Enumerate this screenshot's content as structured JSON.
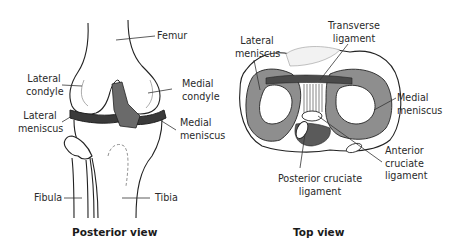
{
  "panels": {
    "posterior": {
      "caption": "Posterior view",
      "labels": {
        "femur": "Femur",
        "lateral_condyle_1": "Lateral",
        "lateral_condyle_2": "condyle",
        "medial_condyle_1": "Medial",
        "medial_condyle_2": "condyle",
        "lateral_meniscus_1": "Lateral",
        "lateral_meniscus_2": "meniscus",
        "medial_meniscus_1": "Medial",
        "medial_meniscus_2": "meniscus",
        "fibula": "Fibula",
        "tibia": "Tibia"
      }
    },
    "top": {
      "caption": "Top view",
      "labels": {
        "lateral_meniscus_1": "Lateral",
        "lateral_meniscus_2": "meniscus",
        "transverse_ligament_1": "Transverse",
        "transverse_ligament_2": "ligament",
        "medial_meniscus_1": "Medial",
        "medial_meniscus_2": "meniscus",
        "anterior_cruciate_1": "Anterior",
        "anterior_cruciate_2": "cruciate",
        "anterior_cruciate_3": "ligament",
        "posterior_cruciate_1": "Posterior cruciate",
        "posterior_cruciate_2": "ligament"
      }
    }
  },
  "colors": {
    "line": "#222222",
    "meniscus_fill": "#8e8e8e",
    "meniscus_dark": "#3a3a3a",
    "bone_fill": "#ffffff",
    "ligament_fill": "#6a6a6a"
  }
}
